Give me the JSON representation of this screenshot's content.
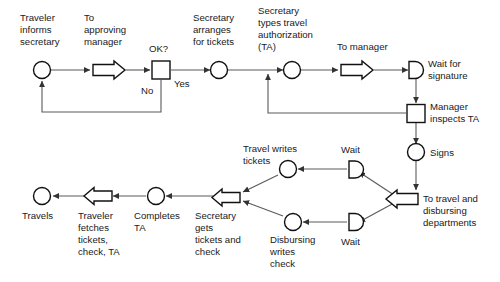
{
  "diagram": {
    "colors": {
      "background": "#ffffff",
      "node_stroke": "#111111",
      "connector": "#5a5a5a",
      "text": "#1a1a1a"
    },
    "labels": {
      "traveler_informs_secretary": [
        "Traveler",
        "informs",
        "secretary"
      ],
      "to_approving_manager": [
        "To",
        "approving",
        "manager"
      ],
      "ok_question": "OK?",
      "no": "No",
      "yes": "Yes",
      "secretary_arranges_for_tickets": [
        "Secretary",
        "arranges",
        "for tickets"
      ],
      "secretary_types_travel_authorization": [
        "Secretary",
        "types travel",
        "authorization",
        "(TA)"
      ],
      "to_manager": "To manager",
      "wait_for_signature": [
        "Wait for",
        "signature"
      ],
      "manager_inspects_ta": [
        "Manager",
        "inspects TA"
      ],
      "signs": "Signs",
      "to_travel_and_disbursing_departments": [
        "To travel and",
        "disbursing",
        "departments"
      ],
      "wait_top": "Wait",
      "wait_bottom": "Wait",
      "travel_writes_tickets": [
        "Travel writes",
        "tickets"
      ],
      "disbursing_writes_check": [
        "Disbursing",
        "writes",
        "check"
      ],
      "secretary_gets_tickets_and_check": [
        "Secretary",
        "gets",
        "tickets and",
        "check"
      ],
      "completes_ta": [
        "Completes",
        "TA"
      ],
      "traveler_fetches_tickets_check_ta": [
        "Traveler",
        "fetches",
        "tickets,",
        "check, TA"
      ],
      "travels": "Travels"
    }
  }
}
